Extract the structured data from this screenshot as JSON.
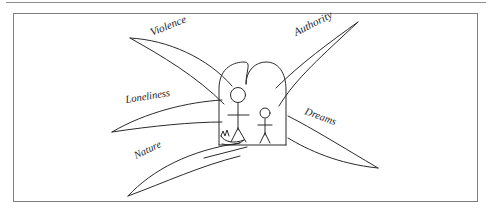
{
  "document": {
    "type": "hand-drawn-diagram",
    "title": "",
    "caption": ""
  },
  "diagram": {
    "center": {
      "structure_name": "twin-arch-enclosure",
      "inhabitants": [
        "large-stick-figure",
        "small-stick-figure"
      ],
      "animal": "small-animal"
    },
    "wings": [
      {
        "id": "violence",
        "label": "Violence",
        "position": "upper-left",
        "label_rotation": -22,
        "label_x": 152,
        "label_y": 36,
        "tip_x": 130,
        "tip_y": 38
      },
      {
        "id": "authority",
        "label": "Authority",
        "position": "upper-right",
        "label_rotation": -27,
        "label_x": 296,
        "label_y": 36,
        "tip_x": 358,
        "tip_y": 22
      },
      {
        "id": "loneliness",
        "label": "Loneliness",
        "position": "middle-left",
        "label_rotation": -9,
        "label_x": 126,
        "label_y": 103,
        "tip_x": 112,
        "tip_y": 132
      },
      {
        "id": "dreams",
        "label": "Dreams",
        "position": "middle-right",
        "label_rotation": 20,
        "label_x": 304,
        "label_y": 114,
        "tip_x": 378,
        "tip_y": 168
      },
      {
        "id": "nature",
        "label": "Nature",
        "position": "lower-left",
        "label_rotation": -26,
        "label_x": 136,
        "label_y": 159,
        "tip_x": 128,
        "tip_y": 196
      }
    ]
  },
  "style": {
    "ink_color": "#2b2b2b",
    "frame_color": "#7e7e7e",
    "rule_color": "#8d8d8d",
    "background_color": "#ffffff"
  }
}
